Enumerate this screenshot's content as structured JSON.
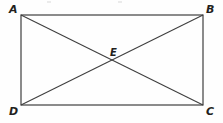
{
  "figure": {
    "type": "rectangle-with-diagonals",
    "background_color": "#fefefe",
    "stroke_color": "#3f3f3f",
    "label_color": "#231f20",
    "rectangle": {
      "name": "ABCD",
      "left": 21,
      "top": 15,
      "right": 203,
      "bottom": 105,
      "width": 182,
      "height": 90,
      "stroke_width": 1.2
    },
    "diagonals": [
      {
        "name": "diagonal-AC",
        "from": "A",
        "to": "C",
        "x1": 21,
        "y1": 15,
        "x2": 203,
        "y2": 105
      },
      {
        "name": "diagonal-BD",
        "from": "B",
        "to": "D",
        "x1": 203,
        "y1": 15,
        "x2": 21,
        "y2": 105
      }
    ],
    "intersection": {
      "name": "E",
      "x": 112,
      "y": 60
    },
    "vertices": [
      {
        "key": "A",
        "label": "A",
        "x": 21,
        "y": 15,
        "label_position": "above-left"
      },
      {
        "key": "B",
        "label": "B",
        "x": 203,
        "y": 15,
        "label_position": "above-right"
      },
      {
        "key": "C",
        "label": "C",
        "x": 203,
        "y": 105,
        "label_position": "below-right"
      },
      {
        "key": "D",
        "label": "D",
        "x": 21,
        "y": 105,
        "label_position": "below-left"
      },
      {
        "key": "E",
        "label": "E",
        "x": 112,
        "y": 60,
        "label_position": "above-center"
      }
    ]
  }
}
